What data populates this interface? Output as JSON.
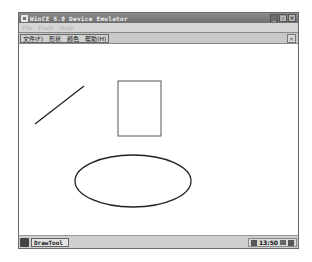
{
  "window": {
    "title": "WinCE 6.0 Device Emulator",
    "buttons": {
      "minimize": "_",
      "maximize": "□",
      "close": "×"
    }
  },
  "emulator_menu": {
    "items": [
      {
        "label": "File"
      },
      {
        "label": "Flash"
      },
      {
        "label": "Help"
      }
    ]
  },
  "app_menu": {
    "items": [
      {
        "label": "文件(F)"
      },
      {
        "label": "形状"
      },
      {
        "label": "颜色"
      },
      {
        "label": "帮助(H)"
      }
    ],
    "close_label": "×"
  },
  "canvas": {
    "shapes": [
      {
        "type": "line",
        "x1": 16,
        "y1": 79,
        "x2": 65,
        "y2": 41,
        "stroke": "#222222"
      },
      {
        "type": "rect",
        "x": 99,
        "y": 36,
        "width": 43,
        "height": 55,
        "stroke": "#555555"
      },
      {
        "type": "ellipse",
        "cx": 114,
        "cy": 136,
        "rx": 58,
        "ry": 26,
        "stroke": "#222222"
      }
    ]
  },
  "taskbar": {
    "start_icon": "start-icon",
    "task_button_label": "DrawTool",
    "clock": "13:50",
    "tray_icons": [
      "input-panel-icon",
      "desktop-icon",
      "network-icon"
    ]
  }
}
